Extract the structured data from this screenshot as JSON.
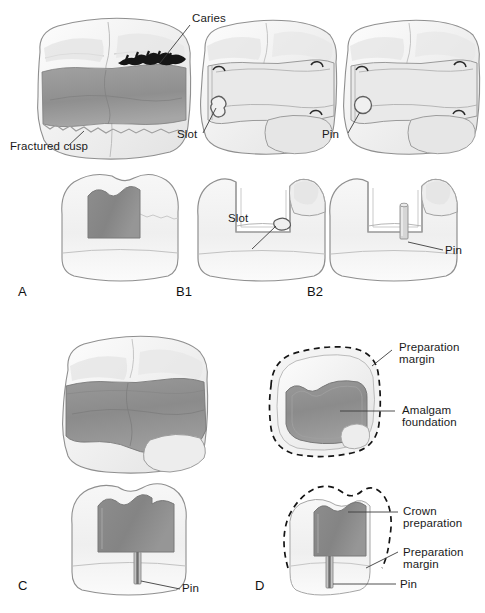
{
  "figure": {
    "panels": [
      {
        "id": "A",
        "id_label": "A",
        "description": "Molar with fractured cusp and caries, occlusal and buccal views"
      },
      {
        "id": "B1",
        "id_label": "B1",
        "description": "Preparation with slot retention, occlusal and buccal views"
      },
      {
        "id": "B2",
        "id_label": "B2",
        "description": "Preparation with pin retention, occlusal and buccal views"
      },
      {
        "id": "C",
        "id_label": "C",
        "description": "Completed amalgam foundation with pin, occlusal and buccal views"
      },
      {
        "id": "D",
        "id_label": "D",
        "description": "Crown preparation over amalgam foundation, occlusal and buccal views"
      }
    ],
    "annotations": {
      "caries": "Caries",
      "fractured_cusp": "Fractured cusp",
      "slot_top": "Slot",
      "slot_bottom": "Slot",
      "pin_b2_top": "Pin",
      "pin_b2_bottom": "Pin",
      "pin_c": "Pin",
      "pin_d": "Pin",
      "preparation_margin_top_line1": "Preparation",
      "preparation_margin_top_line2": "margin",
      "amalgam_foundation_line1": "Amalgam",
      "amalgam_foundation_line2": "foundation",
      "crown_preparation_line1": "Crown",
      "crown_preparation_line2": "preparation",
      "preparation_margin_bottom_line1": "Preparation",
      "preparation_margin_bottom_line2": "margin"
    },
    "colors": {
      "background": "#ffffff",
      "tooth_enamel_light": "#f4f4f4",
      "tooth_outline": "#8c8c8c",
      "amalgam_dark": "#8a8a8a",
      "amalgam_mid": "#9e9e9e",
      "caries_black": "#1a1a1a",
      "label_text": "#1a1a1a",
      "leader_line": "#3a3a3a",
      "dashed_margin": "#1a1a1a"
    }
  }
}
